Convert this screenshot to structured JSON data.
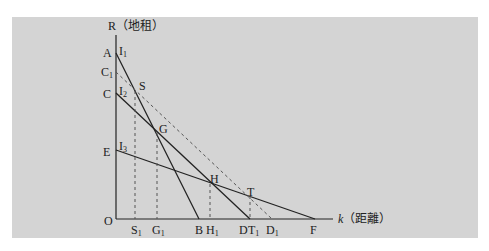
{
  "diagram": {
    "y_axis_label": "R（地租）",
    "x_axis_symbol": "k",
    "x_axis_label": "（距離）",
    "origin": "O",
    "y_points": [
      "A",
      "C",
      "E"
    ],
    "y_point_C1": "C",
    "curve_labels": [
      "I",
      "I",
      "I"
    ],
    "curve_subs": [
      "1",
      "2",
      "3"
    ],
    "intersections": [
      "S",
      "G",
      "H",
      "T"
    ],
    "x_points": {
      "S1": "S",
      "G1": "G",
      "B": "B",
      "H1": "H",
      "D": "D",
      "T1": "T",
      "D1": "D",
      "F": "F"
    },
    "sub1": "1",
    "colors": {
      "background": "#d4d4d4",
      "line": "#222222",
      "dashed": "#555555"
    }
  }
}
